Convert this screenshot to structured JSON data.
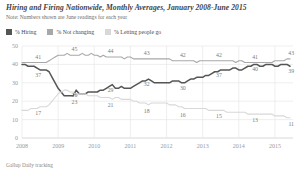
{
  "header": {
    "title": "Hiring and Firing Nationwide, Monthly Averages, January 2008-June 2015",
    "note": "Note: Numbers shown are June readings for each year"
  },
  "legend": {
    "position": "top-left",
    "items": [
      {
        "label": "% Hiring",
        "color": "#555555"
      },
      {
        "label": "% Not changing",
        "color": "#a8a8a8"
      },
      {
        "label": "% Letting people go",
        "color": "#d8d8d8"
      }
    ]
  },
  "source": "Gallup Daily tracking",
  "chart_data": {
    "type": "line",
    "title": "Hiring and Firing Nationwide, Monthly Averages, January 2008-June 2015",
    "subtitle": "Note: Numbers shown are June readings for each year",
    "xlabel": "",
    "ylabel": "",
    "ylim": [
      0,
      50
    ],
    "yticks": [
      0,
      10,
      20,
      30,
      40,
      50
    ],
    "ytick_labels": [
      "0",
      "10",
      "20",
      "30",
      "40",
      "50"
    ],
    "xlim": [
      2008.0,
      2015.5
    ],
    "xticks": [
      2008,
      2009,
      2010,
      2011,
      2012,
      2013,
      2014,
      2015
    ],
    "xtick_labels": [
      "2008",
      "2009",
      "2010",
      "2011",
      "2012",
      "2013",
      "2014",
      "2015"
    ],
    "grid": "vertical-and-horizontal-light",
    "legend_position": "top-left",
    "annotations": [
      {
        "series": "% Hiring",
        "x": 2008.45,
        "value": 37,
        "label": "37"
      },
      {
        "series": "% Hiring",
        "x": 2009.45,
        "value": 26,
        "label": "26"
      },
      {
        "series": "% Hiring",
        "x": 2010.45,
        "value": 29,
        "label": "29"
      },
      {
        "series": "% Hiring",
        "x": 2011.45,
        "value": 32,
        "label": "32"
      },
      {
        "series": "% Hiring",
        "x": 2012.45,
        "value": 30,
        "label": "30"
      },
      {
        "series": "% Hiring",
        "x": 2013.45,
        "value": 37,
        "label": "37"
      },
      {
        "series": "% Hiring",
        "x": 2014.45,
        "value": 40,
        "label": "40"
      },
      {
        "series": "% Hiring",
        "x": 2015.45,
        "value": 39,
        "label": "39"
      },
      {
        "series": "% Not changing",
        "x": 2008.45,
        "value": 41,
        "label": "41"
      },
      {
        "series": "% Not changing",
        "x": 2009.45,
        "value": 45,
        "label": "45"
      },
      {
        "series": "% Not changing",
        "x": 2010.45,
        "value": 44,
        "label": "44"
      },
      {
        "series": "% Not changing",
        "x": 2011.45,
        "value": 43,
        "label": "43"
      },
      {
        "series": "% Not changing",
        "x": 2012.45,
        "value": 42,
        "label": "42"
      },
      {
        "series": "% Not changing",
        "x": 2013.45,
        "value": 42,
        "label": "42"
      },
      {
        "series": "% Not changing",
        "x": 2014.45,
        "value": 41,
        "label": "41"
      },
      {
        "series": "% Not changing",
        "x": 2015.45,
        "value": 43,
        "label": "43"
      },
      {
        "series": "% Letting people go",
        "x": 2008.45,
        "value": 17,
        "label": "17"
      },
      {
        "series": "% Letting people go",
        "x": 2009.45,
        "value": 23,
        "label": "23"
      },
      {
        "series": "% Letting people go",
        "x": 2010.45,
        "value": 21,
        "label": "21"
      },
      {
        "series": "% Letting people go",
        "x": 2011.45,
        "value": 18,
        "label": "18"
      },
      {
        "series": "% Letting people go",
        "x": 2012.45,
        "value": 16,
        "label": "16"
      },
      {
        "series": "% Letting people go",
        "x": 2013.45,
        "value": 15,
        "label": "15"
      },
      {
        "series": "% Letting people go",
        "x": 2014.45,
        "value": 13,
        "label": "13"
      },
      {
        "series": "% Letting people go",
        "x": 2015.45,
        "value": 11,
        "label": "11"
      }
    ],
    "x": [
      2008.0,
      2008.083,
      2008.167,
      2008.25,
      2008.333,
      2008.417,
      2008.5,
      2008.583,
      2008.667,
      2008.75,
      2008.833,
      2008.917,
      2009.0,
      2009.083,
      2009.167,
      2009.25,
      2009.333,
      2009.417,
      2009.5,
      2009.583,
      2009.667,
      2009.75,
      2009.833,
      2009.917,
      2010.0,
      2010.083,
      2010.167,
      2010.25,
      2010.333,
      2010.417,
      2010.5,
      2010.583,
      2010.667,
      2010.75,
      2010.833,
      2010.917,
      2011.0,
      2011.083,
      2011.167,
      2011.25,
      2011.333,
      2011.417,
      2011.5,
      2011.583,
      2011.667,
      2011.75,
      2011.833,
      2011.917,
      2012.0,
      2012.083,
      2012.167,
      2012.25,
      2012.333,
      2012.417,
      2012.5,
      2012.583,
      2012.667,
      2012.75,
      2012.833,
      2012.917,
      2013.0,
      2013.083,
      2013.167,
      2013.25,
      2013.333,
      2013.417,
      2013.5,
      2013.583,
      2013.667,
      2013.75,
      2013.833,
      2013.917,
      2014.0,
      2014.083,
      2014.167,
      2014.25,
      2014.333,
      2014.417,
      2014.5,
      2014.583,
      2014.667,
      2014.75,
      2014.833,
      2014.917,
      2015.0,
      2015.083,
      2015.167,
      2015.25,
      2015.333,
      2015.417
    ],
    "series": [
      {
        "name": "% Hiring",
        "color": "#555555",
        "values": [
          40,
          40,
          39,
          39,
          39,
          38,
          37,
          37,
          37,
          36,
          33,
          30,
          27,
          25,
          23,
          23,
          23,
          23,
          26,
          24,
          24,
          24,
          25,
          25,
          25,
          25,
          26,
          26,
          27,
          28,
          29,
          27,
          27,
          28,
          27,
          27,
          27,
          28,
          29,
          30,
          31,
          31,
          32,
          31,
          30,
          30,
          30,
          30,
          30,
          30,
          31,
          31,
          31,
          30,
          30,
          31,
          32,
          32,
          33,
          33,
          33,
          34,
          34,
          35,
          36,
          36,
          37,
          37,
          37,
          37,
          38,
          38,
          37,
          37,
          38,
          39,
          39,
          40,
          40,
          39,
          39,
          40,
          40,
          40,
          39,
          39,
          40,
          40,
          40,
          39
        ]
      },
      {
        "name": "% Not changing",
        "color": "#a8a8a8",
        "values": [
          41,
          41,
          41,
          41,
          41,
          41,
          41,
          41,
          41,
          42,
          43,
          44,
          45,
          45,
          45,
          46,
          45,
          45,
          45,
          45,
          46,
          45,
          45,
          46,
          45,
          45,
          44,
          45,
          44,
          44,
          44,
          44,
          44,
          44,
          43,
          44,
          44,
          43,
          43,
          43,
          43,
          43,
          43,
          43,
          43,
          43,
          43,
          43,
          43,
          43,
          42,
          42,
          42,
          42,
          42,
          42,
          42,
          42,
          41,
          42,
          42,
          42,
          42,
          42,
          42,
          42,
          42,
          42,
          42,
          42,
          42,
          41,
          42,
          42,
          41,
          41,
          41,
          41,
          41,
          41,
          41,
          41,
          41,
          41,
          42,
          42,
          42,
          42,
          43,
          43
        ]
      },
      {
        "name": "% Letting people go",
        "color": "#d8d8d8",
        "values": [
          15,
          15,
          15,
          16,
          16,
          16,
          17,
          17,
          17,
          18,
          20,
          22,
          24,
          25,
          26,
          26,
          25,
          25,
          23,
          24,
          24,
          24,
          23,
          23,
          23,
          23,
          22,
          22,
          22,
          22,
          21,
          22,
          22,
          21,
          21,
          21,
          21,
          20,
          20,
          19,
          19,
          19,
          18,
          19,
          19,
          19,
          19,
          19,
          19,
          18,
          18,
          18,
          17,
          17,
          16,
          16,
          16,
          16,
          16,
          16,
          16,
          16,
          15,
          15,
          15,
          15,
          15,
          15,
          14,
          14,
          14,
          14,
          14,
          14,
          14,
          13,
          13,
          13,
          13,
          13,
          13,
          13,
          13,
          13,
          12,
          12,
          12,
          12,
          11,
          11
        ]
      }
    ]
  }
}
